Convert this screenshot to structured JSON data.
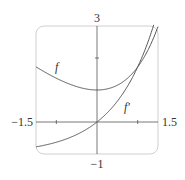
{
  "chart_data": {
    "type": "line",
    "title": "",
    "xlabel": "",
    "ylabel": "",
    "xlim": [
      -1.5,
      1.5
    ],
    "ylim": [
      -1,
      3
    ],
    "grid": false,
    "tick_labels": {
      "x_min": "−1.5",
      "x_max": "1.5",
      "y_max": "3",
      "y_min": "−1"
    },
    "x_ticks": [
      -1,
      1
    ],
    "y_ticks": [
      2
    ],
    "series": [
      {
        "name": "f",
        "label": "f",
        "formula": "e^x - x",
        "x": [
          -1.5,
          -1,
          -0.5,
          0,
          0.5,
          1,
          1.5
        ],
        "values": [
          1.72,
          1.37,
          1.11,
          1.0,
          1.15,
          1.72,
          2.98
        ]
      },
      {
        "name": "f'",
        "label": "f′",
        "formula": "e^x - 1",
        "x": [
          -1.5,
          -1,
          -0.5,
          0,
          0.5,
          1,
          1.5
        ],
        "values": [
          -0.78,
          -0.63,
          -0.39,
          0.0,
          0.65,
          1.72,
          3.48
        ]
      }
    ],
    "annotations": [
      {
        "text": "f",
        "x": -1.0,
        "y": 1.7
      },
      {
        "text": "f′",
        "x": 0.75,
        "y": 0.45
      }
    ]
  }
}
